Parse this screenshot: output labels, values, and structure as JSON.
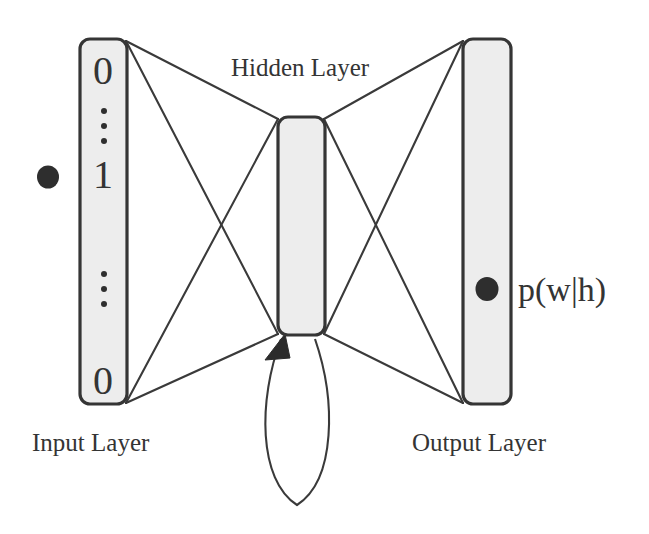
{
  "figure": {
    "type": "diagram",
    "kind": "recurrent-neural-network-architecture",
    "background_color": "#ffffff",
    "line_color": "#3a3a3a",
    "layer_fill_color": "#ededed",
    "layer_border_color": "#353535",
    "dot_color": "#2e2e2e"
  },
  "labels": {
    "hidden_layer": "Hidden Layer",
    "input_layer": "Input Layer",
    "output_layer": "Output Layer",
    "probability": "p(w|h)"
  },
  "input_layer": {
    "name": "Input Layer",
    "cells": [
      {
        "kind": "digit",
        "value": "0"
      },
      {
        "kind": "ellipsis",
        "value": "⋮"
      },
      {
        "kind": "digit",
        "value": "1"
      },
      {
        "kind": "ellipsis",
        "value": "⋮"
      },
      {
        "kind": "digit",
        "value": "0"
      }
    ],
    "marker_dot": {
      "present": true,
      "position": "left-of-active-unit",
      "aligned_with_cell": "1"
    }
  },
  "hidden_layer": {
    "name": "Hidden Layer",
    "cells": [],
    "recurrent_loop": {
      "present": true,
      "direction": "self-feedback",
      "arrowhead": "into-hidden-layer-bottom-left"
    }
  },
  "output_layer": {
    "name": "Output Layer",
    "cells": [],
    "marker_dot": {
      "present": true,
      "label": "p(w|h)"
    }
  },
  "connections": {
    "input_to_hidden": "fully-connected",
    "hidden_to_output": "fully-connected",
    "hidden_to_hidden": "recurrent"
  }
}
